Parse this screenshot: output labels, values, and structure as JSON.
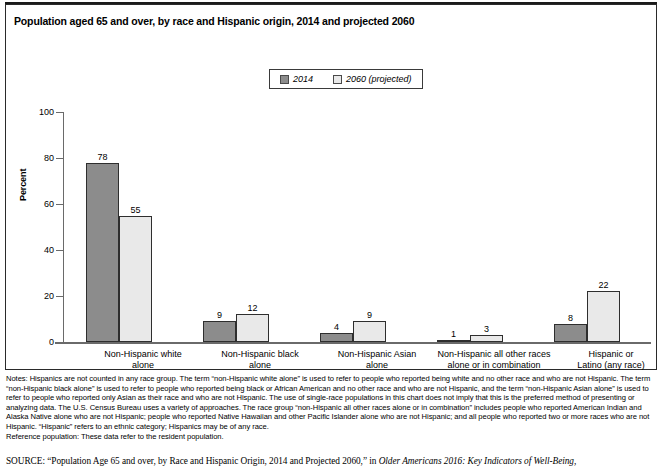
{
  "chart_data": {
    "type": "bar",
    "title": "Population aged 65 and over, by race and Hispanic origin, 2014 and projected 2060",
    "xlabel": "",
    "ylabel": "Percent",
    "ylim": [
      0,
      100
    ],
    "yticks": [
      0,
      20,
      40,
      60,
      80,
      100
    ],
    "grid": false,
    "legend_position": "top-center",
    "categories": [
      "Non-Hispanic white alone",
      "Non-Hispanic black alone",
      "Non-Hispanic Asian alone",
      "Non-Hispanic all other races alone or in combination",
      "Hispanic or Latino (any race)"
    ],
    "category_lines": [
      [
        "Non-Hispanic white",
        "alone"
      ],
      [
        "Non-Hispanic black",
        "alone"
      ],
      [
        "Non-Hispanic Asian",
        "alone"
      ],
      [
        "Non-Hispanic all other races",
        "alone or in combination"
      ],
      [
        "Hispanic or",
        "Latino (any race)"
      ]
    ],
    "series": [
      {
        "name": "2014",
        "color": "#8c8c8c",
        "values": [
          78,
          9,
          4,
          1,
          8
        ]
      },
      {
        "name": "2060 (projected)",
        "color": "#e9e9e9",
        "values": [
          55,
          12,
          9,
          3,
          22
        ]
      }
    ]
  },
  "legend": {
    "entries": [
      {
        "label": "2014",
        "color": "#8c8c8c"
      },
      {
        "label": "2060 (projected)",
        "color": "#e9e9e9"
      }
    ]
  },
  "notes": {
    "body": "Notes: Hispanics are not counted in any race group. The term “non-Hispanic white alone” is used to refer to people who reported being white and no other race and who are not Hispanic. The term “non-Hispanic black alone” is used to refer to people who reported being black or African American and no other race and who are not Hispanic, and the term “non-Hispanic Asian alone” is used to refer to people who reported only Asian as their race and who are not Hispanic. The use of single-race populations in this chart does not imply that this is the preferred method of presenting or analyzing data. The U.S. Census Bureau uses a variety of approaches. The race group “non-Hispanic all other races alone or in combination” includes people who reported American Indian and Alaska Native alone who are not Hispanic; people who reported Native Hawaiian and other Pacific Islander alone who are not Hispanic; and all people who reported two or more races who are not Hispanic. “Hispanic” refers to an ethnic category; Hispanics may be of any race.",
    "reference": "Reference population: These data refer to the resident population."
  },
  "source": {
    "label": "SOURCE:",
    "citation": "“Population Age 65 and over, by Race and Hispanic Origin, 2014 and Projected 2060,” in",
    "publication": "Older Americans 2016: Key Indicators of Well-Being,"
  }
}
